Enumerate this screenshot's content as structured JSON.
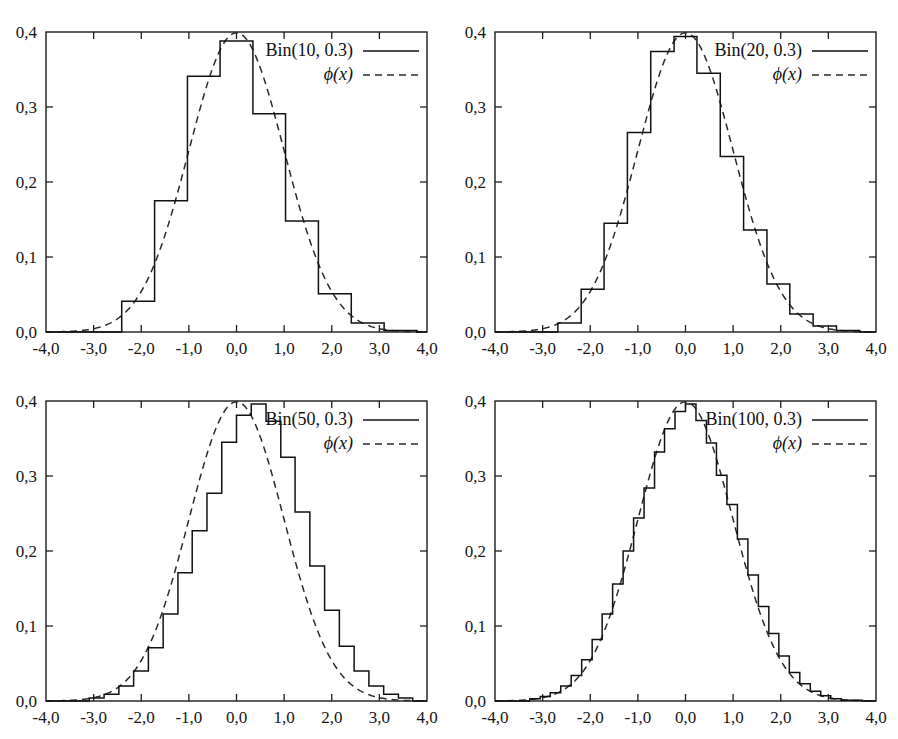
{
  "figure": {
    "caption": "",
    "panel_order": [
      "p10",
      "p20",
      "p50",
      "p100"
    ]
  },
  "axis": {
    "x_ticklabels": [
      "-4,0",
      "-3,0",
      "-2,0",
      "-1,0",
      "0,0",
      "1,0",
      "2,0",
      "3,0",
      "4,0"
    ],
    "y_ticklabels": [
      "0,0",
      "0,1",
      "0,2",
      "0,3",
      "0,4"
    ],
    "x_tickvalues": [
      -4,
      -3,
      -2,
      -1,
      0,
      1,
      2,
      3,
      4
    ],
    "y_tickvalues": [
      0.0,
      0.1,
      0.2,
      0.3,
      0.4
    ],
    "xlim": [
      -4,
      4
    ],
    "ylim": [
      0,
      0.4
    ],
    "grid": false,
    "decimal_separator": ","
  },
  "legend": {
    "normal_label": "ϕ(x)",
    "normal_label_fn": "ϕ",
    "normal_label_arg": "(x)",
    "position": "top-right",
    "solid_sample_name": "solid-line-sample",
    "dashed_sample_name": "dashed-line-sample"
  },
  "colors": {
    "histogram": "#111111",
    "density": "#2a2a2a",
    "frame": "#1c1c1c",
    "background": "#ffffff",
    "text": "#151515"
  },
  "chart_data": [
    {
      "id": "p10",
      "type": "bar",
      "title": "",
      "series_label": "Bin(10, 0.3)",
      "n": 10,
      "p": 0.3,
      "xlabel": "",
      "ylabel": "",
      "xlim": [
        -4,
        4
      ],
      "ylim": [
        0,
        0.4
      ],
      "grid": false,
      "legend": [
        "Bin(10, 0.3)",
        "ϕ(x)"
      ],
      "bin_width": 0.69,
      "bin_edges": [
        -2.41,
        -1.72,
        -1.03,
        -0.345,
        0.345,
        1.03,
        1.72,
        2.41,
        3.1,
        3.79
      ],
      "values": [
        0.041,
        0.175,
        0.341,
        0.388,
        0.291,
        0.148,
        0.051,
        0.012,
        0.002
      ],
      "categories": [
        "-2.07",
        "-1.38",
        "-0.69",
        "0.00",
        "0.69",
        "1.38",
        "2.07",
        "2.76",
        "3.45"
      ],
      "overlay": {
        "name": "standard normal density",
        "label": "ϕ(x)",
        "type": "line",
        "style": "dashed",
        "formula": "phi(x) = exp(-x^2/2)/sqrt(2*pi)",
        "peak_value": 0.3989
      }
    },
    {
      "id": "p20",
      "type": "bar",
      "title": "",
      "series_label": "Bin(20, 0.3)",
      "n": 20,
      "p": 0.3,
      "xlabel": "",
      "ylabel": "",
      "xlim": [
        -4,
        4
      ],
      "ylim": [
        0,
        0.4
      ],
      "grid": false,
      "legend": [
        "Bin(20, 0.3)",
        "ϕ(x)"
      ],
      "bin_width": 0.488,
      "bin_edges": [
        -2.68,
        -2.19,
        -1.71,
        -1.22,
        -0.73,
        -0.24,
        0.24,
        0.73,
        1.22,
        1.71,
        2.19,
        2.68,
        3.17,
        3.66
      ],
      "values": [
        0.012,
        0.057,
        0.145,
        0.266,
        0.374,
        0.394,
        0.345,
        0.234,
        0.136,
        0.064,
        0.024,
        0.008,
        0.002
      ],
      "categories": [
        "-2.44",
        "-1.95",
        "-1.46",
        "-0.98",
        "-0.49",
        "0.00",
        "0.49",
        "0.98",
        "1.46",
        "1.95",
        "2.44",
        "2.93",
        "3.41"
      ],
      "overlay": {
        "name": "standard normal density",
        "label": "ϕ(x)",
        "type": "line",
        "style": "dashed",
        "formula": "phi(x) = exp(-x^2/2)/sqrt(2*pi)",
        "peak_value": 0.3989
      }
    },
    {
      "id": "p50",
      "type": "bar",
      "title": "",
      "series_label": "Bin(50, 0.3)",
      "n": 50,
      "p": 0.3,
      "xlabel": "",
      "ylabel": "",
      "xlim": [
        -4,
        4
      ],
      "ylim": [
        0,
        0.4
      ],
      "grid": false,
      "legend": [
        "Bin(50, 0.3)",
        "ϕ(x)"
      ],
      "bin_width": 0.3086,
      "bin_edges": [
        -3.09,
        -2.78,
        -2.47,
        -2.16,
        -1.85,
        -1.54,
        -1.23,
        -0.93,
        -0.62,
        -0.31,
        0.0,
        0.31,
        0.62,
        0.93,
        1.23,
        1.54,
        1.85,
        2.16,
        2.47,
        2.78,
        3.09,
        3.4,
        3.7
      ],
      "values": [
        0.004,
        0.009,
        0.02,
        0.04,
        0.071,
        0.116,
        0.171,
        0.227,
        0.277,
        0.345,
        0.381,
        0.396,
        0.373,
        0.325,
        0.252,
        0.18,
        0.121,
        0.073,
        0.04,
        0.02,
        0.009,
        0.004
      ],
      "categories": [
        "-2.93",
        "-2.62",
        "-2.31",
        "-2.01",
        "-1.70",
        "-1.39",
        "-1.08",
        "-0.77",
        "-0.46",
        "-0.15",
        "0.15",
        "0.46",
        "0.77",
        "1.08",
        "1.39",
        "1.70",
        "2.01",
        "2.31",
        "2.62",
        "2.93",
        "3.24",
        "3.55"
      ],
      "overlay": {
        "name": "standard normal density",
        "label": "ϕ(x)",
        "type": "line",
        "style": "dashed",
        "formula": "phi(x) = exp(-x^2/2)/sqrt(2*pi)",
        "peak_value": 0.3989
      }
    },
    {
      "id": "p100",
      "type": "bar",
      "title": "",
      "series_label": "Bin(100, 0.3)",
      "n": 100,
      "p": 0.3,
      "xlabel": "",
      "ylabel": "",
      "xlim": [
        -4,
        4
      ],
      "ylim": [
        0,
        0.4
      ],
      "grid": false,
      "legend": [
        "Bin(100, 0.3)",
        "ϕ(x)"
      ],
      "bin_width": 0.2182,
      "bin_edges": [
        -3.27,
        -3.05,
        -2.84,
        -2.62,
        -2.4,
        -2.18,
        -1.96,
        -1.75,
        -1.53,
        -1.31,
        -1.09,
        -0.87,
        -0.65,
        -0.44,
        -0.22,
        0.0,
        0.22,
        0.44,
        0.65,
        0.87,
        1.09,
        1.31,
        1.53,
        1.75,
        1.96,
        2.18,
        2.4,
        2.62,
        2.84,
        3.05,
        3.27,
        3.49,
        3.71
      ],
      "values": [
        0.003,
        0.006,
        0.011,
        0.02,
        0.034,
        0.055,
        0.082,
        0.116,
        0.156,
        0.2,
        0.244,
        0.284,
        0.332,
        0.363,
        0.386,
        0.396,
        0.374,
        0.344,
        0.301,
        0.262,
        0.216,
        0.168,
        0.126,
        0.09,
        0.06,
        0.038,
        0.023,
        0.013,
        0.007,
        0.003,
        0.001,
        0.001
      ],
      "categories": [
        "-3.16",
        "-2.95",
        "-2.73",
        "-2.51",
        "-2.29",
        "-2.07",
        "-1.86",
        "-1.64",
        "-1.42",
        "-1.20",
        "-0.98",
        "-0.76",
        "-0.55",
        "-0.33",
        "-0.11",
        "0.11",
        "0.33",
        "0.55",
        "0.76",
        "0.98",
        "1.20",
        "1.42",
        "1.64",
        "1.86",
        "2.07",
        "2.29",
        "2.51",
        "2.73",
        "2.95",
        "3.16",
        "3.38",
        "3.60"
      ],
      "overlay": {
        "name": "standard normal density",
        "label": "ϕ(x)",
        "type": "line",
        "style": "dashed",
        "formula": "phi(x) = exp(-x^2/2)/sqrt(2*pi)",
        "peak_value": 0.3989
      }
    }
  ]
}
